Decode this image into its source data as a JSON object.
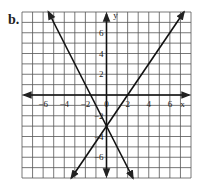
{
  "problem_label": "b.",
  "chart_data": {
    "type": "line",
    "title": "",
    "xlabel": "x",
    "ylabel": "y",
    "xlim": [
      -8,
      8
    ],
    "ylim": [
      -8,
      8
    ],
    "grid": true,
    "x_ticks": [
      -6,
      -4,
      -2,
      0,
      2,
      4,
      6
    ],
    "y_ticks": [
      6,
      4,
      2,
      -2,
      -4,
      -6
    ],
    "series": [
      {
        "name": "line-decreasing",
        "equation": "y = -2x - 3",
        "points": [
          [
            -5.5,
            8
          ],
          [
            2.5,
            -8
          ]
        ]
      },
      {
        "name": "line-increasing",
        "equation": "y = 1.5x - 3",
        "points": [
          [
            -3.33,
            -8
          ],
          [
            7.33,
            8
          ]
        ]
      }
    ],
    "intersection": [
      0,
      -3
    ]
  }
}
